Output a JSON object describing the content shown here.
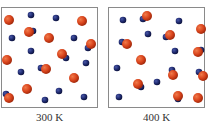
{
  "colors": {
    "red": "#d9441c",
    "blue": "#1f2a6e",
    "border": "#8a8a8a"
  },
  "panels": [
    {
      "label": "300 K",
      "red": [
        [
          9,
          20
        ],
        [
          82,
          21
        ],
        [
          29,
          32
        ],
        [
          49,
          38
        ],
        [
          91,
          44
        ],
        [
          62,
          54
        ],
        [
          7,
          60
        ],
        [
          46,
          69
        ],
        [
          74,
          78
        ],
        [
          27,
          89
        ],
        [
          9,
          98
        ]
      ],
      "blue_bonded": [
        [
          33,
          31
        ],
        [
          88,
          48
        ],
        [
          66,
          58
        ],
        [
          41,
          68
        ],
        [
          6,
          94
        ]
      ],
      "blue": [
        [
          31,
          15
        ],
        [
          56,
          18
        ],
        [
          12,
          38
        ],
        [
          74,
          38
        ],
        [
          31,
          51
        ],
        [
          86,
          63
        ],
        [
          21,
          72
        ],
        [
          59,
          91
        ],
        [
          84,
          97
        ],
        [
          45,
          100
        ]
      ]
    },
    {
      "label": "400 K",
      "red": [
        [
          147,
          16
        ],
        [
          201,
          29
        ],
        [
          127,
          44
        ],
        [
          170,
          35
        ],
        [
          141,
          60
        ],
        [
          198,
          52
        ],
        [
          173,
          75
        ],
        [
          203,
          76
        ],
        [
          138,
          84
        ],
        [
          178,
          96
        ],
        [
          198,
          98
        ]
      ],
      "blue_bonded": [
        [
          143,
          19
        ],
        [
          122,
          42
        ],
        [
          166,
          37
        ],
        [
          201,
          50
        ],
        [
          172,
          70
        ],
        [
          199,
          72
        ],
        [
          141,
          87
        ],
        [
          178,
          99
        ]
      ],
      "blue": [
        [
          123,
          20
        ],
        [
          179,
          21
        ],
        [
          148,
          34
        ],
        [
          175,
          51
        ],
        [
          117,
          68
        ],
        [
          157,
          82
        ],
        [
          119,
          97
        ]
      ]
    }
  ]
}
